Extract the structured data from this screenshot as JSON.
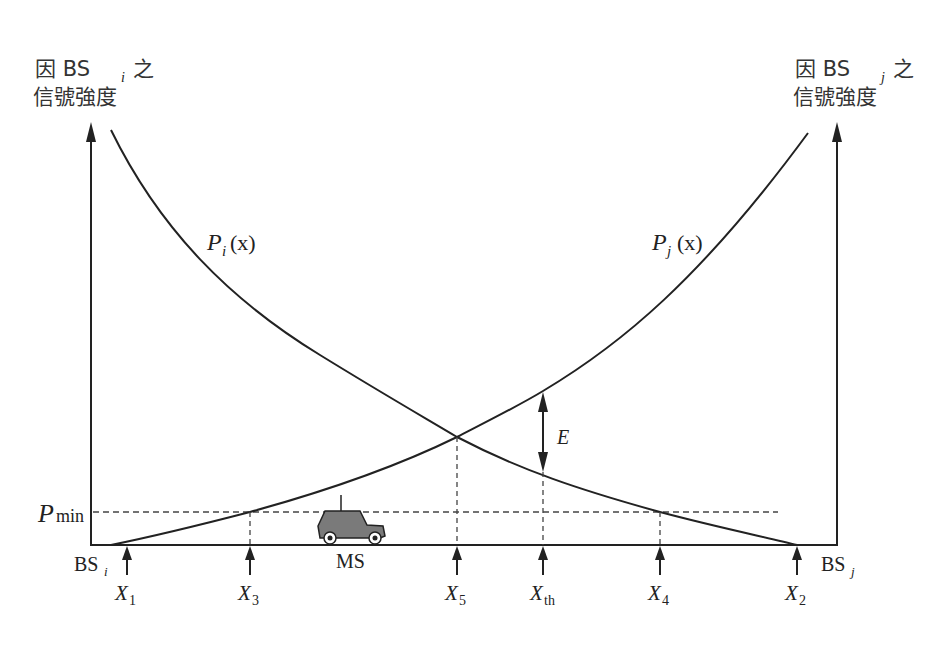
{
  "diagram": {
    "left_axis": {
      "line1_prefix": "因 BS",
      "line1_sub": "i",
      "line1_suffix": "之",
      "line2": "信號強度"
    },
    "right_axis": {
      "line1_prefix": "因 BS",
      "line1_sub": "j",
      "line1_suffix": "之",
      "line2": "信號強度"
    },
    "curves": {
      "pi": {
        "base": "P",
        "sub": "i",
        "arg": "(x)"
      },
      "pj": {
        "base": "P",
        "sub": "j",
        "arg": "(x)"
      }
    },
    "pmin": {
      "base": "P",
      "sub": "min"
    },
    "e_label": "E",
    "base_stations": {
      "left": {
        "base": "BS",
        "sub": "i"
      },
      "right": {
        "base": "BS",
        "sub": "j"
      }
    },
    "mobile_station": "MS",
    "x_markers": [
      {
        "base": "X",
        "sub": "1"
      },
      {
        "base": "X",
        "sub": "3"
      },
      {
        "base": "X",
        "sub": "5"
      },
      {
        "base": "X",
        "sub": "th"
      },
      {
        "base": "X",
        "sub": "4"
      },
      {
        "base": "X",
        "sub": "2"
      }
    ],
    "colors": {
      "line": "#222222",
      "car_fill": "#7a7a7a",
      "dashed": "#444444"
    }
  }
}
